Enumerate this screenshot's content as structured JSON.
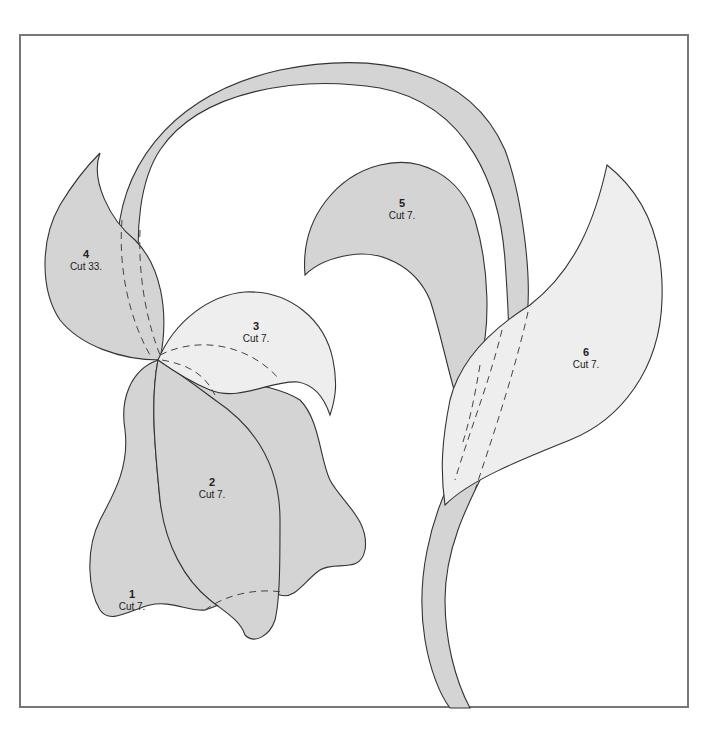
{
  "diagram": {
    "type": "applique-pattern",
    "colors": {
      "dark_fill": "#d4d4d4",
      "light_fill": "#eeeeee",
      "outline": "#333333",
      "frame": "#777777"
    },
    "pieces": [
      {
        "number": "1",
        "instruction": "Cut 7.",
        "part": "left petal"
      },
      {
        "number": "2",
        "instruction": "Cut 7.",
        "part": "center petal"
      },
      {
        "number": "3",
        "instruction": "Cut 7.",
        "part": "top curled petal"
      },
      {
        "number": "4",
        "instruction": "Cut 33.",
        "part": "upper-left leaf"
      },
      {
        "number": "5",
        "instruction": "Cut 7.",
        "part": "curled leaf"
      },
      {
        "number": "6",
        "instruction": "Cut 7.",
        "part": "right leaf"
      }
    ]
  }
}
